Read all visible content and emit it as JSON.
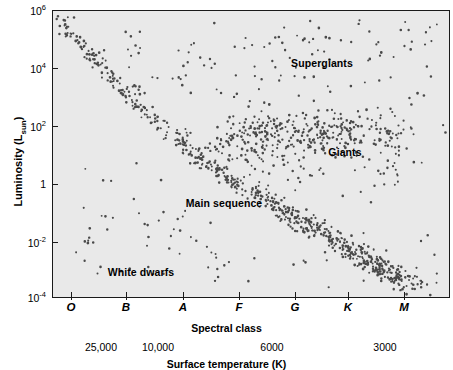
{
  "chart_data": {
    "type": "scatter",
    "title": "",
    "xlabel": "Spectral class",
    "ylabel": "Luminosity (Lsun)",
    "secondary_xlabel": "Surface temperature (K)",
    "grid": false,
    "legend": "none",
    "y_tick_labels": [
      "10",
      "10",
      "10",
      "1",
      "10",
      "10"
    ],
    "y_ticks": [
      {
        "mantissa": "10",
        "exponent": "6",
        "value": 1000000.0,
        "y_px": 10
      },
      {
        "mantissa": "10",
        "exponent": "4",
        "value": 10000.0,
        "y_px": 68
      },
      {
        "mantissa": "10",
        "exponent": "2",
        "value": 100.0,
        "y_px": 126
      },
      {
        "mantissa": "1",
        "exponent": "",
        "value": 1,
        "y_px": 184
      },
      {
        "mantissa": "10",
        "exponent": "-2",
        "value": 0.01,
        "y_px": 242
      },
      {
        "mantissa": "10",
        "exponent": "-4",
        "value": 0.0001,
        "y_px": 297
      }
    ],
    "ylim_log10": [
      -4,
      6
    ],
    "x_ticks": [
      {
        "label": "O",
        "x_px": 71
      },
      {
        "label": "B",
        "x_px": 126
      },
      {
        "label": "A",
        "x_px": 183
      },
      {
        "label": "F",
        "x_px": 239
      },
      {
        "label": "G",
        "x_px": 295
      },
      {
        "label": "K",
        "x_px": 348
      },
      {
        "label": "M",
        "x_px": 404
      }
    ],
    "temperature_ticks": [
      {
        "label": "25,000",
        "x_px": 101
      },
      {
        "label": "10,000",
        "x_px": 158
      },
      {
        "label": "6000",
        "x_px": 272
      },
      {
        "label": "3000",
        "x_px": 385
      }
    ],
    "annotations": [
      {
        "text": "Supergiants",
        "x_px": 322,
        "y_px": 63
      },
      {
        "text": "Giants",
        "x_px": 345,
        "y_px": 152
      },
      {
        "text": "Main sequence",
        "x_px": 224,
        "y_px": 203
      },
      {
        "text": "White dwarfs",
        "x_px": 141,
        "y_px": 272
      }
    ],
    "populations": [
      {
        "name": "main-sequence",
        "description": "Dense diagonal band from hot/luminous upper-left to cool/dim lower-right",
        "n_points": 560
      },
      {
        "name": "giants",
        "description": "Horizontal clump at luminosity ~10 to ~1000 on the cool right side",
        "n_points": 230
      },
      {
        "name": "supergiants",
        "description": "Sparse scatter across the top at luminosity ~10^4 to 10^6",
        "n_points": 70
      },
      {
        "name": "white-dwarfs",
        "description": "Sparse scatter in the lower-left at luminosity ~10^-4 to 10^-1",
        "n_points": 30
      }
    ],
    "marker": {
      "color": "#4a4a4a",
      "size_px": 1.9,
      "shape": "dot"
    },
    "plot_background": "#e9e9e9",
    "axis_color": "#1a1a1a"
  },
  "axes": {
    "y_title_main": "Luminosity (L",
    "y_title_sub": "sun",
    "y_title_close": ")",
    "x_title": "Spectral class",
    "temp_title": "Surface temperature (K)"
  }
}
